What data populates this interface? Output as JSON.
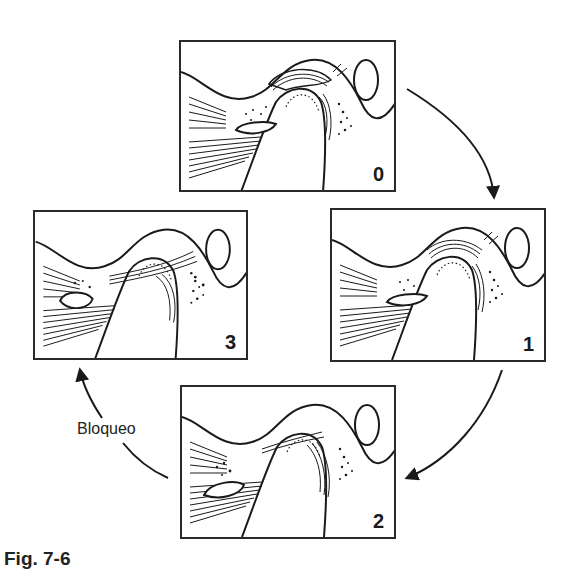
{
  "figure": {
    "caption": "Fig. 7-6",
    "transition_label": "Bloqueo",
    "colors": {
      "line": "#1a1a1a",
      "background": "#ffffff"
    },
    "panels": [
      {
        "id": "panel-0",
        "number": "0",
        "position": "top"
      },
      {
        "id": "panel-1",
        "number": "1",
        "position": "right"
      },
      {
        "id": "panel-2",
        "number": "2",
        "position": "bottom"
      },
      {
        "id": "panel-3",
        "number": "3",
        "position": "left"
      }
    ],
    "cycle": [
      "0",
      "1",
      "2",
      "3"
    ]
  }
}
